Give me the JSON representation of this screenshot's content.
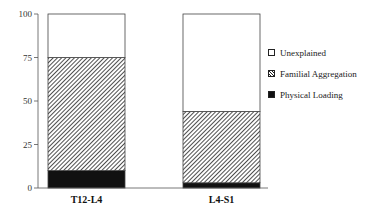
{
  "chart_data": {
    "type": "bar",
    "stacked": true,
    "title": "",
    "xlabel": "",
    "ylabel": "",
    "ylim": [
      0,
      100
    ],
    "yticks": [
      0,
      25,
      50,
      75,
      100
    ],
    "categories": [
      "T12-L4",
      "L4-S1"
    ],
    "series": [
      {
        "name": "Physical Loading",
        "fill": "black",
        "values": [
          10,
          3
        ]
      },
      {
        "name": "Familial Aggregation",
        "fill": "hatch",
        "values": [
          65,
          41
        ]
      },
      {
        "name": "Unexplained",
        "fill": "white",
        "values": [
          25,
          56
        ]
      }
    ],
    "legend_position": "right"
  },
  "legend": {
    "items": [
      {
        "label": "Unexplained"
      },
      {
        "label": "Familial Aggregation"
      },
      {
        "label": "Physical Loading"
      }
    ]
  }
}
